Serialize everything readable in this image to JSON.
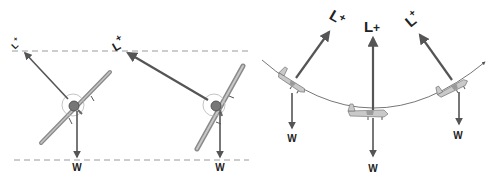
{
  "figure": {
    "colors": {
      "arrow": "#555555",
      "dashed_line": "#9a9a9a",
      "airplane": "#9c9c9c",
      "airplane_dark": "#555555",
      "label": "#222222",
      "arc": "#666666"
    },
    "left_panel": {
      "reference_lines": [
        "top-dashed-line",
        "bottom-dashed-line"
      ],
      "aircraft": [
        {
          "id": "banked-moderate",
          "lift_label": "L+",
          "weight_label": "W",
          "lift_label_rotation_deg": -45
        },
        {
          "id": "banked-steep",
          "lift_label": "L+",
          "weight_label": "W",
          "lift_label_rotation_deg": -30
        }
      ]
    },
    "right_panel": {
      "path": "curved-flight-path",
      "aircraft": [
        {
          "id": "pitch-down-left",
          "lift_label": "L+",
          "weight_label": "W",
          "lift_label_rotation_deg": 30
        },
        {
          "id": "level-bottom",
          "lift_label": "L+",
          "weight_label": "W",
          "lift_label_rotation_deg": 0
        },
        {
          "id": "pitch-up-right",
          "lift_label": "L+",
          "weight_label": "W",
          "lift_label_rotation_deg": -40
        }
      ]
    }
  }
}
